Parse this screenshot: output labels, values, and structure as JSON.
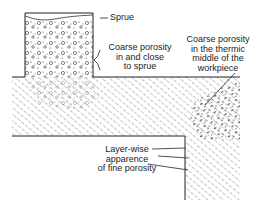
{
  "figure": {
    "type": "cross-section diagram"
  },
  "labels": {
    "sprue": "Sprue",
    "coarse_sprue": [
      "Coarse porosity",
      "in and close",
      "to sprue"
    ],
    "coarse_thermic": [
      "Coarse porosity",
      "in the thermic",
      "middle of the",
      "workpiece"
    ],
    "layer_wise": [
      "Layer-wise",
      "apparence",
      "of fine porosity"
    ]
  },
  "colors": {
    "ink": "#222222",
    "background": "#ffffff"
  }
}
